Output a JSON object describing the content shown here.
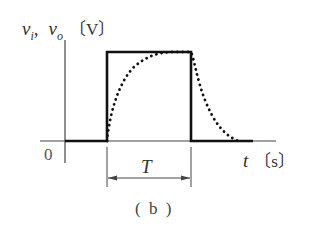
{
  "diagram": {
    "y_axis_label_vi": "v",
    "y_axis_label_vi_sub": "i",
    "y_axis_label_sep": ",",
    "y_axis_label_vo": "v",
    "y_axis_label_vo_sub": "o",
    "y_axis_unit": "〔V〕",
    "x_axis_label": "t",
    "x_axis_unit": "〔s〕",
    "origin_label": "0",
    "pulse_width_label": "T",
    "caption": "( b )",
    "series": [
      {
        "name": "v_i",
        "style": "solid",
        "shape": "rectangular pulse"
      },
      {
        "name": "v_o",
        "style": "dotted",
        "shape": "exponential rise and decay"
      }
    ]
  }
}
